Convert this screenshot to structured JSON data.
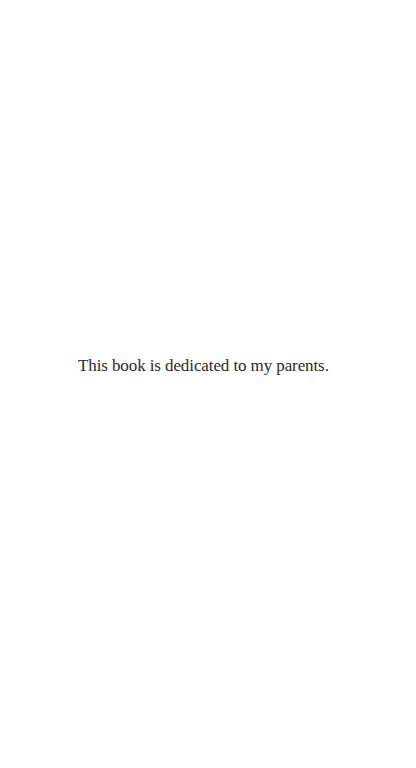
{
  "page": {
    "dedication": "This book is dedicated to my parents."
  }
}
